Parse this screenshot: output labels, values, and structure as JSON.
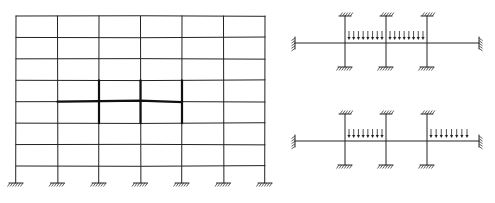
{
  "diagram": {
    "frame": {
      "bays": 6,
      "storeys": 8,
      "base_support": "fixed",
      "highlighted_floor_from_top": 4,
      "highlighted_bays": [
        1,
        2,
        3,
        4
      ],
      "highlighted_columns": [
        2,
        3,
        4
      ]
    },
    "subframes": [
      {
        "name": "load-case-a",
        "columns": 3,
        "column_ends": "fixed",
        "beam_ends": "fixed",
        "loaded_spans": [
          2,
          3
        ],
        "arrows_per_span": 8
      },
      {
        "name": "load-case-b",
        "columns": 3,
        "column_ends": "fixed",
        "beam_ends": "fixed",
        "loaded_spans": [
          2,
          4
        ],
        "arrows_per_span": 8
      }
    ],
    "colors": {
      "line": "#222222",
      "background": "#ffffff"
    }
  }
}
